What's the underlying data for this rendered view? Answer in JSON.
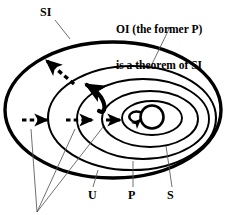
{
  "diagram": {
    "type": "venn-nested-ellipses",
    "stroke_color": "#000000",
    "background_color": "#ffffff",
    "labels": {
      "si": "SI",
      "u": "U",
      "p": "P",
      "s": "S"
    },
    "annotation": {
      "line1": "OI (the former P)",
      "line2": "is a theorem of SI"
    },
    "regions": [
      {
        "name": "SI",
        "label": "SI",
        "role": "outermost-ellipse",
        "stroke_width": 3.2
      },
      {
        "name": "U",
        "label": "U",
        "role": "second-ellipse",
        "stroke_width": 2.0
      },
      {
        "name": "P",
        "label": "P",
        "role": "third-ellipse",
        "stroke_width": 1.8
      },
      {
        "name": "S",
        "label": "S",
        "role": "fourth-ellipse",
        "stroke_width": 1.8
      },
      {
        "name": "OI",
        "label": "OI",
        "role": "innermost-circle",
        "stroke_width": 2.6
      }
    ],
    "arrows": [
      {
        "name": "dashed-arrow-outer",
        "style": "dashed",
        "direction": "right"
      },
      {
        "name": "dashed-arrow-middle",
        "style": "dashed",
        "direction": "right"
      },
      {
        "name": "solid-arrow-inner",
        "style": "solid",
        "direction": "right"
      },
      {
        "name": "dashed-arrow-upleft",
        "style": "dashed",
        "direction": "up-left"
      },
      {
        "name": "hooked-arrow-upleft",
        "style": "solid-hooked",
        "direction": "up-left"
      },
      {
        "name": "loop-arrow-oi",
        "style": "solid-loop",
        "direction": "left"
      }
    ]
  }
}
